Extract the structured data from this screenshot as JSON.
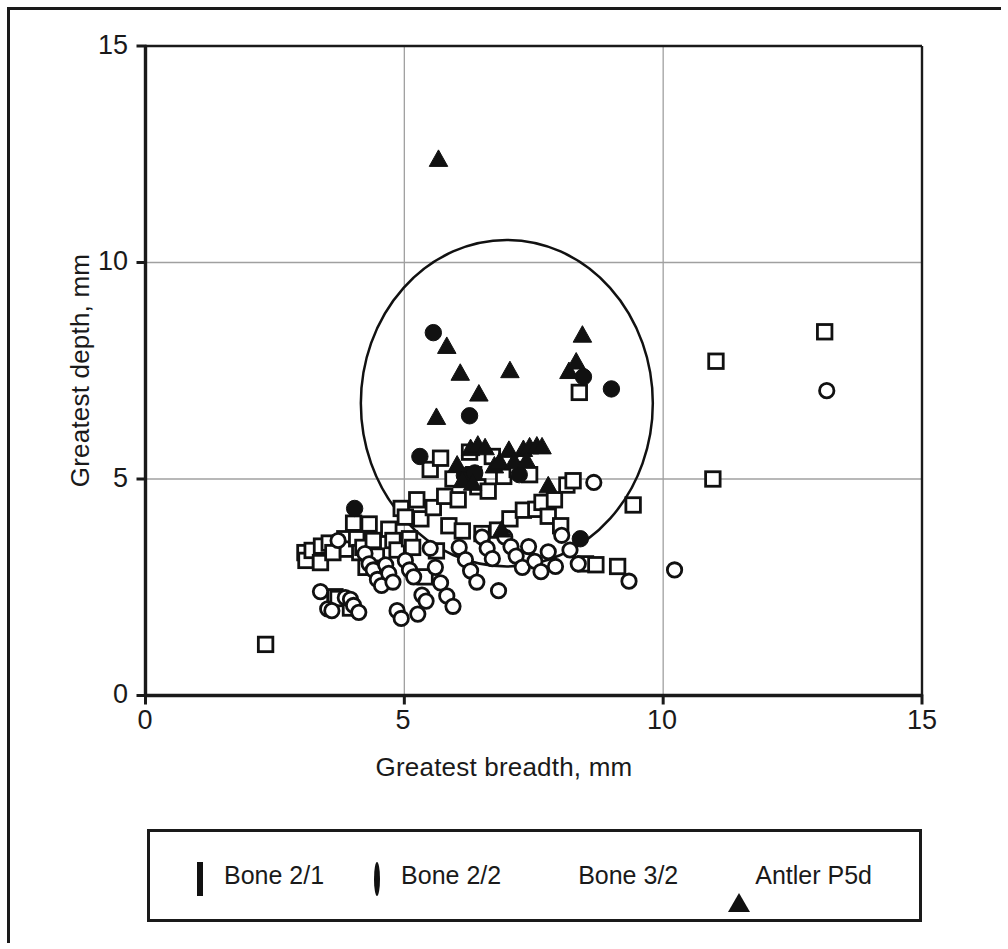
{
  "figure": {
    "background": "#ffffff",
    "frame_color": "#1a1a1a"
  },
  "axes": {
    "x_title": "Greatest breadth, mm",
    "y_title": "Greatest depth, mm",
    "x_ticks": [
      "0",
      "5",
      "10",
      "15"
    ],
    "y_ticks": [
      "0",
      "5",
      "10",
      "15"
    ]
  },
  "legend": {
    "entries": [
      {
        "label": "Bone 2/1",
        "marker": "open-square"
      },
      {
        "label": "Bone 2/2",
        "marker": "open-circle"
      },
      {
        "label": "Bone 3/2",
        "marker": "filled-circle"
      },
      {
        "label": "Antler P5d",
        "marker": "filled-triangle"
      }
    ]
  },
  "chart_data": {
    "type": "scatter",
    "title": "",
    "xlabel": "Greatest breadth, mm",
    "ylabel": "Greatest depth, mm",
    "xlim": [
      0,
      15
    ],
    "ylim": [
      0,
      15
    ],
    "xticks": [
      0,
      5,
      10,
      15
    ],
    "yticks": [
      0,
      5,
      10,
      15
    ],
    "grid": true,
    "grid_color": "#a0a0a0",
    "legend_position": "below-plot",
    "marker_color": "#111111",
    "annotations": [
      {
        "type": "ellipse",
        "name": "cluster-outline-circle",
        "center": [
          6.98,
          6.75
        ],
        "rx": 2.82,
        "ry": 3.77,
        "stroke": "#111111",
        "stroke_width": 2.5,
        "fill": "none"
      }
    ],
    "series": [
      {
        "name": "Bone 2/1",
        "marker": "open-square",
        "points": [
          [
            2.32,
            1.18
          ],
          [
            3.08,
            3.3
          ],
          [
            3.1,
            3.12
          ],
          [
            3.22,
            3.35
          ],
          [
            3.4,
            3.45
          ],
          [
            3.38,
            3.07
          ],
          [
            3.55,
            3.52
          ],
          [
            3.62,
            3.3
          ],
          [
            3.66,
            2.28
          ],
          [
            3.72,
            2.24
          ],
          [
            3.85,
            3.62
          ],
          [
            3.9,
            3.38
          ],
          [
            3.96,
            2.02
          ],
          [
            4.02,
            3.98
          ],
          [
            4.08,
            3.62
          ],
          [
            4.14,
            3.3
          ],
          [
            4.2,
            3.42
          ],
          [
            4.26,
            2.96
          ],
          [
            4.32,
            3.96
          ],
          [
            4.4,
            3.58
          ],
          [
            4.46,
            3.22
          ],
          [
            4.52,
            2.94
          ],
          [
            4.58,
            2.88
          ],
          [
            4.7,
            3.84
          ],
          [
            4.78,
            3.58
          ],
          [
            4.86,
            3.36
          ],
          [
            4.94,
            4.32
          ],
          [
            5.02,
            4.12
          ],
          [
            5.1,
            3.62
          ],
          [
            5.16,
            3.42
          ],
          [
            5.24,
            4.52
          ],
          [
            5.32,
            4.08
          ],
          [
            5.4,
            2.74
          ],
          [
            5.5,
            5.22
          ],
          [
            5.56,
            4.34
          ],
          [
            5.62,
            3.34
          ],
          [
            5.7,
            5.48
          ],
          [
            5.78,
            4.6
          ],
          [
            5.86,
            3.92
          ],
          [
            5.94,
            5.0
          ],
          [
            6.04,
            4.52
          ],
          [
            6.12,
            3.8
          ],
          [
            6.26,
            5.62
          ],
          [
            6.34,
            5.1
          ],
          [
            6.42,
            4.82
          ],
          [
            6.5,
            3.74
          ],
          [
            6.62,
            4.72
          ],
          [
            6.7,
            5.52
          ],
          [
            6.8,
            3.82
          ],
          [
            6.92,
            5.06
          ],
          [
            7.04,
            4.08
          ],
          [
            7.18,
            5.22
          ],
          [
            7.3,
            4.28
          ],
          [
            7.42,
            5.1
          ],
          [
            7.54,
            4.3
          ],
          [
            7.66,
            4.46
          ],
          [
            7.78,
            4.14
          ],
          [
            7.9,
            4.52
          ],
          [
            8.02,
            3.92
          ],
          [
            8.14,
            4.86
          ],
          [
            8.26,
            4.96
          ],
          [
            8.38,
            7.0
          ],
          [
            8.5,
            3.04
          ],
          [
            8.7,
            3.02
          ],
          [
            9.12,
            2.98
          ],
          [
            9.42,
            4.4
          ],
          [
            10.96,
            5.0
          ],
          [
            11.02,
            7.72
          ],
          [
            13.12,
            8.4
          ]
        ]
      },
      {
        "name": "Bone 2/2",
        "marker": "open-circle",
        "points": [
          [
            3.38,
            2.4
          ],
          [
            3.52,
            2.0
          ],
          [
            3.6,
            1.96
          ],
          [
            3.72,
            3.58
          ],
          [
            3.86,
            2.26
          ],
          [
            3.96,
            2.22
          ],
          [
            4.02,
            2.08
          ],
          [
            4.12,
            1.92
          ],
          [
            4.24,
            3.28
          ],
          [
            4.32,
            3.04
          ],
          [
            4.4,
            2.9
          ],
          [
            4.48,
            2.68
          ],
          [
            4.56,
            2.54
          ],
          [
            4.64,
            3.02
          ],
          [
            4.7,
            2.82
          ],
          [
            4.78,
            2.62
          ],
          [
            4.86,
            1.96
          ],
          [
            4.94,
            1.78
          ],
          [
            5.02,
            3.12
          ],
          [
            5.1,
            2.9
          ],
          [
            5.18,
            2.74
          ],
          [
            5.26,
            1.88
          ],
          [
            5.34,
            2.32
          ],
          [
            5.42,
            2.18
          ],
          [
            5.5,
            3.4
          ],
          [
            5.6,
            2.96
          ],
          [
            5.7,
            2.6
          ],
          [
            5.82,
            2.3
          ],
          [
            5.94,
            2.06
          ],
          [
            6.06,
            3.42
          ],
          [
            6.18,
            3.14
          ],
          [
            6.28,
            2.88
          ],
          [
            6.4,
            2.62
          ],
          [
            6.5,
            3.66
          ],
          [
            6.6,
            3.4
          ],
          [
            6.7,
            3.16
          ],
          [
            6.82,
            2.42
          ],
          [
            6.94,
            3.66
          ],
          [
            7.06,
            3.44
          ],
          [
            7.16,
            3.22
          ],
          [
            7.28,
            2.96
          ],
          [
            7.4,
            3.44
          ],
          [
            7.52,
            3.1
          ],
          [
            7.64,
            2.86
          ],
          [
            7.78,
            3.32
          ],
          [
            7.92,
            2.98
          ],
          [
            8.04,
            3.7
          ],
          [
            8.2,
            3.36
          ],
          [
            8.36,
            3.04
          ],
          [
            8.66,
            4.92
          ],
          [
            9.34,
            2.64
          ],
          [
            10.22,
            2.9
          ],
          [
            13.16,
            7.04
          ]
        ]
      },
      {
        "name": "Bone 3/2",
        "marker": "filled-circle",
        "points": [
          [
            4.04,
            4.32
          ],
          [
            5.3,
            5.52
          ],
          [
            5.56,
            8.38
          ],
          [
            6.26,
            6.46
          ],
          [
            6.16,
            5.08
          ],
          [
            6.36,
            5.14
          ],
          [
            7.22,
            5.1
          ],
          [
            8.4,
            3.62
          ],
          [
            8.46,
            7.36
          ],
          [
            9.0,
            7.08
          ]
        ]
      },
      {
        "name": "Antler P5d",
        "marker": "filled-triangle",
        "points": [
          [
            5.66,
            12.38
          ],
          [
            5.82,
            8.06
          ],
          [
            6.08,
            7.44
          ],
          [
            5.62,
            6.42
          ],
          [
            6.44,
            6.96
          ],
          [
            6.28,
            5.7
          ],
          [
            6.42,
            5.78
          ],
          [
            6.56,
            5.72
          ],
          [
            6.74,
            5.3
          ],
          [
            6.84,
            5.4
          ],
          [
            7.04,
            7.5
          ],
          [
            7.02,
            5.66
          ],
          [
            7.12,
            5.4
          ],
          [
            6.02,
            5.32
          ],
          [
            6.12,
            4.96
          ],
          [
            6.32,
            4.9
          ],
          [
            7.3,
            5.68
          ],
          [
            7.42,
            5.74
          ],
          [
            7.36,
            5.42
          ],
          [
            7.56,
            5.76
          ],
          [
            7.66,
            5.74
          ],
          [
            7.78,
            4.84
          ],
          [
            8.18,
            7.48
          ],
          [
            8.32,
            7.7
          ],
          [
            8.44,
            8.32
          ],
          [
            6.88,
            3.82
          ]
        ]
      }
    ]
  }
}
